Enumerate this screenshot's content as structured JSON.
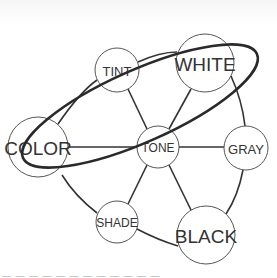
{
  "diagram": {
    "colors": {
      "background": "#ffffff",
      "line": "#333333",
      "node_stroke": "#555555",
      "text": "#333333",
      "highlight_ellipse": "#2a2a2a"
    },
    "nodes": [
      {
        "id": "tint",
        "label": "TINT",
        "cx": 117,
        "cy": 70,
        "r": 22,
        "font_size": 13
      },
      {
        "id": "white",
        "label": "WHITE",
        "cx": 205,
        "cy": 63,
        "r": 29,
        "font_size": 19
      },
      {
        "id": "color",
        "label": "COLOR",
        "cx": 38,
        "cy": 147,
        "r": 30,
        "font_size": 19
      },
      {
        "id": "tone",
        "label": "TONE",
        "cx": 158,
        "cy": 147,
        "r": 21,
        "font_size": 12
      },
      {
        "id": "gray",
        "label": "GRAY",
        "cx": 246,
        "cy": 148,
        "r": 22,
        "font_size": 13
      },
      {
        "id": "shade",
        "label": "SHADE",
        "cx": 117,
        "cy": 222,
        "r": 21,
        "font_size": 12
      },
      {
        "id": "black",
        "label": "BLACK",
        "cx": 206,
        "cy": 235,
        "r": 29,
        "font_size": 19
      }
    ],
    "edges": [
      {
        "from": "tone",
        "to": "color"
      },
      {
        "from": "tone",
        "to": "tint"
      },
      {
        "from": "tone",
        "to": "white"
      },
      {
        "from": "tone",
        "to": "gray"
      },
      {
        "from": "tone",
        "to": "shade"
      },
      {
        "from": "tone",
        "to": "black"
      }
    ],
    "outer_frame": "Curved triangle connecting COLOR-TINT-WHITE-GRAY-BLACK-SHADE-COLOR",
    "highlight": {
      "description": "Thick ellipse enclosing TINT, WHITE, COLOR, TONE",
      "encloses": [
        "TINT",
        "WHITE",
        "COLOR",
        "TONE"
      ]
    },
    "footer_text": "— — — — — — — — — — — —"
  }
}
